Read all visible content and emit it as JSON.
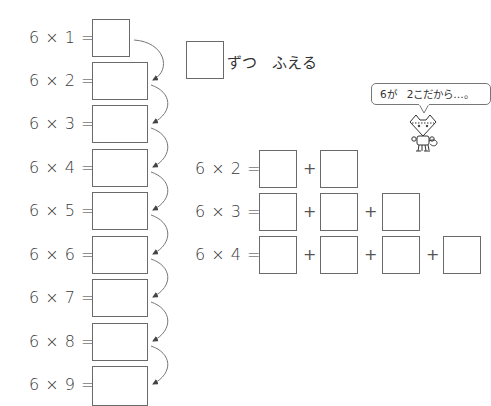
{
  "left_column": {
    "rows": [
      {
        "label": "6 × 1 =",
        "answer": ""
      },
      {
        "label": "6 × 2 =",
        "answer": ""
      },
      {
        "label": "6 × 3 =",
        "answer": ""
      },
      {
        "label": "6 × 4 =",
        "answer": ""
      },
      {
        "label": "6 × 5 =",
        "answer": ""
      },
      {
        "label": "6 × 6 =",
        "answer": ""
      },
      {
        "label": "6 × 7 =",
        "answer": ""
      },
      {
        "label": "6 × 8 =",
        "answer": ""
      },
      {
        "label": "6 × 9 =",
        "answer": ""
      }
    ]
  },
  "increment_note": {
    "answer": "",
    "text": "ずつ　ふえる"
  },
  "speech_bubble": {
    "text": "6が　2こだから…。"
  },
  "right_column": {
    "plus_sign": "+",
    "rows": [
      {
        "label": "6 × 2 =",
        "terms": 2
      },
      {
        "label": "6 × 3 =",
        "terms": 3
      },
      {
        "label": "6 × 4 =",
        "terms": 4
      }
    ]
  },
  "colors": {
    "text": "#3a3a3a",
    "box_border": "#6a6a6a",
    "arrow": "#555555"
  }
}
